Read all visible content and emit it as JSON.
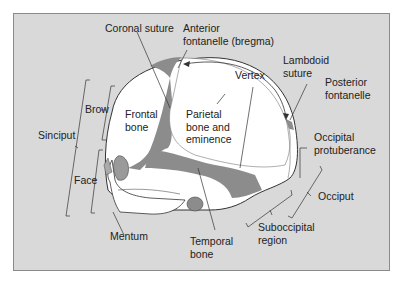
{
  "diagram": {
    "colors": {
      "background": "#d9d9d9",
      "bone": "#ffffff",
      "fontanelle_suture_fill": "#8c8c8c",
      "outline": "#333333",
      "label_text": "#222222"
    },
    "labels": {
      "coronal_suture": "Coronal suture",
      "anterior_fontanelle_line1": "Anterior",
      "anterior_fontanelle_line2": "fontanelle (bregma)",
      "lambdoid_suture_line1": "Lambdoid",
      "lambdoid_suture_line2": "suture",
      "vertex": "Vertex",
      "posterior_fontanelle_line1": "Posterior",
      "posterior_fontanelle_line2": "fontanelle",
      "brow": "Brow",
      "frontal_bone_line1": "Frontal",
      "frontal_bone_line2": "bone",
      "parietal_line1": "Parietal",
      "parietal_line2": "bone and",
      "parietal_line3": "eminence",
      "sinciput": "Sinciput",
      "occipital_protuberance_line1": "Occipital",
      "occipital_protuberance_line2": "protuberance",
      "face": "Face",
      "occiput": "Occiput",
      "mentum": "Mentum",
      "temporal_bone_line1": "Temporal",
      "temporal_bone_line2": "bone",
      "suboccipital_line1": "Suboccipital",
      "suboccipital_line2": "region"
    }
  }
}
